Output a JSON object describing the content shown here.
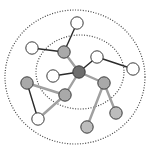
{
  "diagram": {
    "type": "network-graph",
    "colors": {
      "background": "#ffffff",
      "hub_fill": "#6e6e6e",
      "gray_fill": "#a9a9a9",
      "light_gray_fill": "#bdbdbd",
      "white_fill": "#ffffff",
      "node_stroke": "#3a3a3a",
      "dark_edge": "#2a2a2a",
      "light_edge": "#a0a0a0",
      "boundary": "#444444"
    },
    "boundaries": [
      {
        "id": "outer",
        "cx": 75,
        "cy": 77,
        "rx": 70,
        "ry": 67
      },
      {
        "id": "inner",
        "cx": 80,
        "cy": 72,
        "rx": 44,
        "ry": 37
      }
    ],
    "nodes": [
      {
        "id": "hub",
        "x": 79,
        "y": 72,
        "kind": "hub"
      },
      {
        "id": "top-white",
        "x": 77,
        "y": 23,
        "kind": "white"
      },
      {
        "id": "upper-left-white",
        "x": 32,
        "y": 48,
        "kind": "white"
      },
      {
        "id": "upper-left-gray",
        "x": 64,
        "y": 52,
        "kind": "gray"
      },
      {
        "id": "upper-right-white",
        "x": 97,
        "y": 57,
        "kind": "white"
      },
      {
        "id": "right-white",
        "x": 133,
        "y": 69,
        "kind": "white"
      },
      {
        "id": "left-center-white",
        "x": 53,
        "y": 76,
        "kind": "white"
      },
      {
        "id": "right-gray",
        "x": 104,
        "y": 83,
        "kind": "gray"
      },
      {
        "id": "left-gray",
        "x": 27,
        "y": 83,
        "kind": "gray"
      },
      {
        "id": "middle-gray",
        "x": 65,
        "y": 95,
        "kind": "gray"
      },
      {
        "id": "bottom-right-gray",
        "x": 116,
        "y": 113,
        "kind": "light"
      },
      {
        "id": "bottom-left-white",
        "x": 38,
        "y": 119,
        "kind": "white"
      },
      {
        "id": "bottom-middle-gray",
        "x": 87,
        "y": 127,
        "kind": "light"
      }
    ],
    "edges": [
      {
        "from": "top-white",
        "to": "upper-left-gray",
        "style": "dark"
      },
      {
        "from": "upper-left-white",
        "to": "upper-left-gray",
        "style": "dark"
      },
      {
        "from": "upper-left-gray",
        "to": "hub",
        "style": "light"
      },
      {
        "from": "hub",
        "to": "upper-right-white",
        "style": "dark"
      },
      {
        "from": "upper-right-white",
        "to": "right-white",
        "style": "dark"
      },
      {
        "from": "hub",
        "to": "left-center-white",
        "style": "dark"
      },
      {
        "from": "hub",
        "to": "right-gray",
        "style": "light"
      },
      {
        "from": "hub",
        "to": "middle-gray",
        "style": "light"
      },
      {
        "from": "left-gray",
        "to": "middle-gray",
        "style": "light"
      },
      {
        "from": "left-gray",
        "to": "bottom-left-white",
        "style": "dark"
      },
      {
        "from": "middle-gray",
        "to": "bottom-left-white",
        "style": "light"
      },
      {
        "from": "right-gray",
        "to": "bottom-right-gray",
        "style": "light"
      },
      {
        "from": "right-gray",
        "to": "bottom-middle-gray",
        "style": "light"
      }
    ]
  }
}
